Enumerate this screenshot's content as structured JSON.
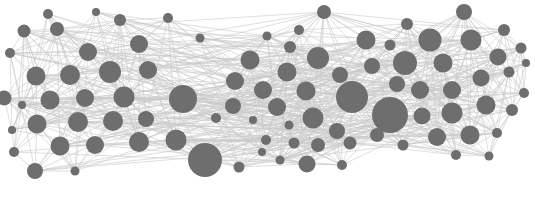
{
  "figure": {
    "type": "node-link-diagram",
    "background_color": "#ffffff",
    "node_color": "#6e6e6e",
    "edge_color": "#c9c9c9",
    "edge_width": 0.7,
    "width": 535,
    "height": 215
  },
  "chart_data": {
    "type": "scatter",
    "subtitle": "",
    "xlabel": "",
    "ylabel": "",
    "xlim": [
      0,
      535
    ],
    "ylim": [
      0,
      215
    ],
    "grid": false,
    "legend": "none",
    "node_count": 92,
    "edge_count": 312,
    "cluster_count": 3,
    "clusters": [
      {
        "name": "left-cluster",
        "center": [
          75,
          95
        ],
        "node_count": 32
      },
      {
        "name": "center-cluster",
        "center": [
          300,
          100
        ],
        "node_count": 31
      },
      {
        "name": "right-cluster",
        "center": [
          455,
          85
        ],
        "node_count": 29
      }
    ],
    "nodes": [
      {
        "id": 0,
        "x": 48,
        "y": 14,
        "r": 5.0,
        "cluster": "left-cluster"
      },
      {
        "id": 1,
        "x": 96,
        "y": 12,
        "r": 4.0,
        "cluster": "left-cluster"
      },
      {
        "id": 2,
        "x": 120,
        "y": 20,
        "r": 6.0,
        "cluster": "left-cluster"
      },
      {
        "id": 3,
        "x": 168,
        "y": 18,
        "r": 5.0,
        "cluster": "left-cluster"
      },
      {
        "id": 4,
        "x": 24,
        "y": 31,
        "r": 6.5,
        "cluster": "left-cluster"
      },
      {
        "id": 5,
        "x": 57,
        "y": 29,
        "r": 7.0,
        "cluster": "left-cluster"
      },
      {
        "id": 6,
        "x": 139,
        "y": 44,
        "r": 9.0,
        "cluster": "left-cluster"
      },
      {
        "id": 7,
        "x": 10,
        "y": 53,
        "r": 5.0,
        "cluster": "left-cluster"
      },
      {
        "id": 8,
        "x": 88,
        "y": 52,
        "r": 9.0,
        "cluster": "left-cluster"
      },
      {
        "id": 9,
        "x": 36,
        "y": 76,
        "r": 9.5,
        "cluster": "left-cluster"
      },
      {
        "id": 10,
        "x": 70,
        "y": 75,
        "r": 10.0,
        "cluster": "left-cluster"
      },
      {
        "id": 11,
        "x": 110,
        "y": 72,
        "r": 11.0,
        "cluster": "left-cluster"
      },
      {
        "id": 12,
        "x": 148,
        "y": 70,
        "r": 9.0,
        "cluster": "left-cluster"
      },
      {
        "id": 13,
        "x": 4,
        "y": 98,
        "r": 7.5,
        "cluster": "left-cluster"
      },
      {
        "id": 14,
        "x": 50,
        "y": 100,
        "r": 9.5,
        "cluster": "left-cluster"
      },
      {
        "id": 15,
        "x": 85,
        "y": 98,
        "r": 9.0,
        "cluster": "left-cluster"
      },
      {
        "id": 16,
        "x": 124,
        "y": 97,
        "r": 10.5,
        "cluster": "left-cluster"
      },
      {
        "id": 17,
        "x": 183,
        "y": 99,
        "r": 14.0,
        "cluster": "left-cluster"
      },
      {
        "id": 18,
        "x": 22,
        "y": 105,
        "r": 4.0,
        "cluster": "left-cluster"
      },
      {
        "id": 19,
        "x": 12,
        "y": 130,
        "r": 4.0,
        "cluster": "left-cluster"
      },
      {
        "id": 20,
        "x": 37,
        "y": 124,
        "r": 9.5,
        "cluster": "left-cluster"
      },
      {
        "id": 21,
        "x": 78,
        "y": 122,
        "r": 10.0,
        "cluster": "left-cluster"
      },
      {
        "id": 22,
        "x": 113,
        "y": 121,
        "r": 10.0,
        "cluster": "left-cluster"
      },
      {
        "id": 23,
        "x": 146,
        "y": 119,
        "r": 8.0,
        "cluster": "left-cluster"
      },
      {
        "id": 24,
        "x": 60,
        "y": 146,
        "r": 9.5,
        "cluster": "left-cluster"
      },
      {
        "id": 25,
        "x": 95,
        "y": 145,
        "r": 9.0,
        "cluster": "left-cluster"
      },
      {
        "id": 26,
        "x": 139,
        "y": 142,
        "r": 10.0,
        "cluster": "left-cluster"
      },
      {
        "id": 27,
        "x": 176,
        "y": 140,
        "r": 10.5,
        "cluster": "left-cluster"
      },
      {
        "id": 28,
        "x": 14,
        "y": 152,
        "r": 5.0,
        "cluster": "left-cluster"
      },
      {
        "id": 29,
        "x": 35,
        "y": 171,
        "r": 8.0,
        "cluster": "left-cluster"
      },
      {
        "id": 30,
        "x": 75,
        "y": 171,
        "r": 4.5,
        "cluster": "left-cluster"
      },
      {
        "id": 31,
        "x": 205,
        "y": 160,
        "r": 17.0,
        "cluster": "left-cluster"
      },
      {
        "id": 32,
        "x": 239,
        "y": 167,
        "r": 5.5,
        "cluster": "left-cluster"
      },
      {
        "id": 33,
        "x": 267,
        "y": 36,
        "r": 4.5,
        "cluster": "center-cluster"
      },
      {
        "id": 34,
        "x": 290,
        "y": 47,
        "r": 6.0,
        "cluster": "center-cluster"
      },
      {
        "id": 35,
        "x": 250,
        "y": 60,
        "r": 9.5,
        "cluster": "center-cluster"
      },
      {
        "id": 36,
        "x": 318,
        "y": 58,
        "r": 11.0,
        "cluster": "center-cluster"
      },
      {
        "id": 37,
        "x": 287,
        "y": 72,
        "r": 9.5,
        "cluster": "center-cluster"
      },
      {
        "id": 38,
        "x": 235,
        "y": 81,
        "r": 9.0,
        "cluster": "center-cluster"
      },
      {
        "id": 39,
        "x": 263,
        "y": 90,
        "r": 9.0,
        "cluster": "center-cluster"
      },
      {
        "id": 40,
        "x": 306,
        "y": 91,
        "r": 9.5,
        "cluster": "center-cluster"
      },
      {
        "id": 41,
        "x": 352,
        "y": 97,
        "r": 16.0,
        "cluster": "center-cluster"
      },
      {
        "id": 42,
        "x": 233,
        "y": 106,
        "r": 8.0,
        "cluster": "center-cluster"
      },
      {
        "id": 43,
        "x": 277,
        "y": 107,
        "r": 9.0,
        "cluster": "center-cluster"
      },
      {
        "id": 44,
        "x": 253,
        "y": 120,
        "r": 4.0,
        "cluster": "center-cluster"
      },
      {
        "id": 45,
        "x": 289,
        "y": 125,
        "r": 4.5,
        "cluster": "center-cluster"
      },
      {
        "id": 46,
        "x": 313,
        "y": 118,
        "r": 10.5,
        "cluster": "center-cluster"
      },
      {
        "id": 47,
        "x": 337,
        "y": 131,
        "r": 8.0,
        "cluster": "center-cluster"
      },
      {
        "id": 48,
        "x": 294,
        "y": 143,
        "r": 5.5,
        "cluster": "center-cluster"
      },
      {
        "id": 49,
        "x": 318,
        "y": 145,
        "r": 7.0,
        "cluster": "center-cluster"
      },
      {
        "id": 50,
        "x": 350,
        "y": 143,
        "r": 6.5,
        "cluster": "center-cluster"
      },
      {
        "id": 51,
        "x": 307,
        "y": 164,
        "r": 8.5,
        "cluster": "center-cluster"
      },
      {
        "id": 52,
        "x": 342,
        "y": 165,
        "r": 5.0,
        "cluster": "center-cluster"
      },
      {
        "id": 53,
        "x": 280,
        "y": 160,
        "r": 4.5,
        "cluster": "center-cluster"
      },
      {
        "id": 54,
        "x": 266,
        "y": 140,
        "r": 5.0,
        "cluster": "center-cluster"
      },
      {
        "id": 55,
        "x": 324,
        "y": 12,
        "r": 7.0,
        "cluster": "center-cluster"
      },
      {
        "id": 56,
        "x": 366,
        "y": 40,
        "r": 9.5,
        "cluster": "center-cluster"
      },
      {
        "id": 57,
        "x": 340,
        "y": 75,
        "r": 8.0,
        "cluster": "center-cluster"
      },
      {
        "id": 58,
        "x": 216,
        "y": 118,
        "r": 5.0,
        "cluster": "center-cluster"
      },
      {
        "id": 59,
        "x": 299,
        "y": 30,
        "r": 5.0,
        "cluster": "center-cluster"
      },
      {
        "id": 60,
        "x": 262,
        "y": 152,
        "r": 4.0,
        "cluster": "center-cluster"
      },
      {
        "id": 61,
        "x": 390,
        "y": 115,
        "r": 18.0,
        "cluster": "right-cluster"
      },
      {
        "id": 62,
        "x": 372,
        "y": 66,
        "r": 8.0,
        "cluster": "right-cluster"
      },
      {
        "id": 63,
        "x": 397,
        "y": 84,
        "r": 8.0,
        "cluster": "right-cluster"
      },
      {
        "id": 64,
        "x": 405,
        "y": 63,
        "r": 12.0,
        "cluster": "right-cluster"
      },
      {
        "id": 65,
        "x": 430,
        "y": 40,
        "r": 11.5,
        "cluster": "right-cluster"
      },
      {
        "id": 66,
        "x": 464,
        "y": 12,
        "r": 8.0,
        "cluster": "right-cluster"
      },
      {
        "id": 67,
        "x": 443,
        "y": 63,
        "r": 9.5,
        "cluster": "right-cluster"
      },
      {
        "id": 68,
        "x": 471,
        "y": 40,
        "r": 10.5,
        "cluster": "right-cluster"
      },
      {
        "id": 69,
        "x": 504,
        "y": 30,
        "r": 6.0,
        "cluster": "right-cluster"
      },
      {
        "id": 70,
        "x": 498,
        "y": 57,
        "r": 8.5,
        "cluster": "right-cluster"
      },
      {
        "id": 71,
        "x": 521,
        "y": 48,
        "r": 5.5,
        "cluster": "right-cluster"
      },
      {
        "id": 72,
        "x": 420,
        "y": 90,
        "r": 9.0,
        "cluster": "right-cluster"
      },
      {
        "id": 73,
        "x": 452,
        "y": 90,
        "r": 9.0,
        "cluster": "right-cluster"
      },
      {
        "id": 74,
        "x": 481,
        "y": 78,
        "r": 8.5,
        "cluster": "right-cluster"
      },
      {
        "id": 75,
        "x": 509,
        "y": 72,
        "r": 5.5,
        "cluster": "right-cluster"
      },
      {
        "id": 76,
        "x": 524,
        "y": 93,
        "r": 5.0,
        "cluster": "right-cluster"
      },
      {
        "id": 77,
        "x": 422,
        "y": 116,
        "r": 8.5,
        "cluster": "right-cluster"
      },
      {
        "id": 78,
        "x": 452,
        "y": 113,
        "r": 10.5,
        "cluster": "right-cluster"
      },
      {
        "id": 79,
        "x": 486,
        "y": 105,
        "r": 9.5,
        "cluster": "right-cluster"
      },
      {
        "id": 80,
        "x": 512,
        "y": 110,
        "r": 6.0,
        "cluster": "right-cluster"
      },
      {
        "id": 81,
        "x": 437,
        "y": 137,
        "r": 9.0,
        "cluster": "right-cluster"
      },
      {
        "id": 82,
        "x": 470,
        "y": 135,
        "r": 9.5,
        "cluster": "right-cluster"
      },
      {
        "id": 83,
        "x": 497,
        "y": 133,
        "r": 5.0,
        "cluster": "right-cluster"
      },
      {
        "id": 84,
        "x": 403,
        "y": 145,
        "r": 5.5,
        "cluster": "right-cluster"
      },
      {
        "id": 85,
        "x": 456,
        "y": 155,
        "r": 5.0,
        "cluster": "right-cluster"
      },
      {
        "id": 86,
        "x": 489,
        "y": 156,
        "r": 4.5,
        "cluster": "right-cluster"
      },
      {
        "id": 87,
        "x": 407,
        "y": 24,
        "r": 6.0,
        "cluster": "right-cluster"
      },
      {
        "id": 88,
        "x": 390,
        "y": 45,
        "r": 5.5,
        "cluster": "right-cluster"
      },
      {
        "id": 89,
        "x": 377,
        "y": 135,
        "r": 7.0,
        "cluster": "right-cluster"
      },
      {
        "id": 90,
        "x": 526,
        "y": 63,
        "r": 4.0,
        "cluster": "right-cluster"
      },
      {
        "id": 91,
        "x": 200,
        "y": 38,
        "r": 4.5,
        "cluster": "left-cluster"
      }
    ]
  }
}
